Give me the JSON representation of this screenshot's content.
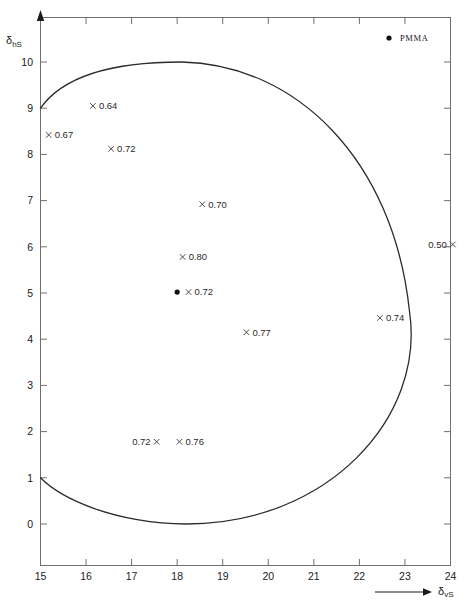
{
  "figure": {
    "caption": "",
    "legend": {
      "marker": "filled-dot",
      "label": "PMMA"
    }
  },
  "chart_data": {
    "type": "scatter",
    "title": "",
    "xlabel": "δvS",
    "ylabel": "δhS",
    "xlim": [
      15,
      24
    ],
    "ylim": [
      0,
      10
    ],
    "grid": false,
    "legend_position": "top-right",
    "xticks": [
      15,
      16,
      17,
      18,
      19,
      20,
      21,
      22,
      23,
      24
    ],
    "yticks": [
      0,
      1,
      2,
      3,
      4,
      5,
      6,
      7,
      8,
      9,
      10
    ],
    "xtick_labels": [
      "15",
      "16",
      "17",
      "18",
      "19",
      "20",
      "21",
      "22",
      "23",
      "24"
    ],
    "ytick_labels": [
      "0",
      "1",
      "2",
      "3",
      "4",
      "5",
      "6",
      "7",
      "8",
      "9",
      "10"
    ],
    "annotation_note": "Numbers beside each × marker are solubility/interaction values",
    "points": [
      {
        "x": 16.15,
        "y": 9.05,
        "label": "0.64",
        "marker": "x",
        "label_side": "right"
      },
      {
        "x": 15.18,
        "y": 8.42,
        "label": "0.67",
        "marker": "x",
        "label_side": "right"
      },
      {
        "x": 16.55,
        "y": 8.12,
        "label": "0.72",
        "marker": "x",
        "label_side": "right"
      },
      {
        "x": 18.55,
        "y": 6.92,
        "label": "0.70",
        "marker": "x",
        "label_side": "right"
      },
      {
        "x": 18.12,
        "y": 5.78,
        "label": "0.80",
        "marker": "x",
        "label_side": "right"
      },
      {
        "x": 18.25,
        "y": 5.02,
        "label": "0.72",
        "marker": "x",
        "label_side": "right"
      },
      {
        "x": 19.52,
        "y": 4.15,
        "label": "0.77",
        "marker": "x",
        "label_side": "right"
      },
      {
        "x": 22.45,
        "y": 4.46,
        "label": "0.74",
        "marker": "x",
        "label_side": "right"
      },
      {
        "x": 24.05,
        "y": 6.05,
        "label": "0.50",
        "marker": "x",
        "label_side": "left"
      },
      {
        "x": 17.55,
        "y": 1.78,
        "label": "0.72",
        "marker": "x",
        "label_side": "left"
      },
      {
        "x": 18.05,
        "y": 1.78,
        "label": "0.76",
        "marker": "x",
        "label_side": "right"
      }
    ],
    "special_points": [
      {
        "x": 18.0,
        "y": 5.02,
        "label": "PMMA",
        "marker": "filled-dot",
        "show_label": false
      }
    ],
    "curve": {
      "name": "solubility-envelope",
      "description": "open arc from (15,9) over the top to the right bulge and back to (15,1)",
      "endpoints": [
        [
          15,
          9
        ],
        [
          15,
          1
        ]
      ],
      "apex_top": [
        18.1,
        10.0
      ],
      "apex_right": [
        23.1,
        4.6
      ],
      "apex_bottom": [
        18.2,
        0.0
      ]
    }
  }
}
